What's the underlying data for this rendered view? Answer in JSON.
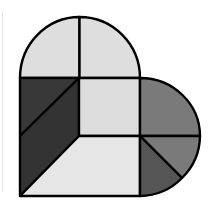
{
  "diagram": {
    "title": "",
    "canvas": {
      "width": 213,
      "height": 211
    },
    "outline_color": "#000000",
    "regions": [
      {
        "name": "top-left-quarter-arc",
        "fill": "#dedede"
      },
      {
        "name": "top-right-quarter-arc",
        "fill": "#dedede"
      },
      {
        "name": "left-upper-triangle",
        "fill": "#383838"
      },
      {
        "name": "left-lower-quad",
        "fill": "#333333"
      },
      {
        "name": "center-square",
        "fill": "#dcdcdc"
      },
      {
        "name": "bottom-trapezoid",
        "fill": "#e6e6e6"
      },
      {
        "name": "right-upper-quarter-arc",
        "fill": "#7a7a7a"
      },
      {
        "name": "right-lower-wedge-outer",
        "fill": "#7a7a7a"
      },
      {
        "name": "right-lower-wedge-inner",
        "fill": "#555555"
      }
    ]
  }
}
